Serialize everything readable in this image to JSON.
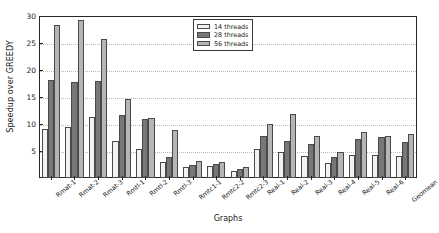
{
  "chart_data": {
    "type": "bar",
    "title": "",
    "xlabel": "Graphs",
    "ylabel": "Speedup over GREEDY",
    "ylim": [
      0,
      30
    ],
    "yticks": [
      5,
      10,
      15,
      20,
      25,
      30
    ],
    "grid": true,
    "legend_position": "top-right",
    "categories": [
      "Rmat-1",
      "Rmat-2",
      "Rmat-3",
      "Rmtl-1",
      "Rmtl-2",
      "Rmtl-3",
      "Rmtc1-1",
      "Rmtc2-2",
      "Rmtc2-3",
      "Real-1",
      "Real-2",
      "Real-3",
      "Real-4",
      "Real-5",
      "Real-6",
      "Geomean"
    ],
    "series": [
      {
        "name": "14 threads",
        "color": "#f2f2f2",
        "values": [
          9.0,
          9.4,
          11.3,
          6.8,
          5.4,
          3.0,
          2.0,
          2.3,
          1.3,
          5.4,
          4.9,
          4.1,
          2.8,
          4.2,
          4.2,
          4.1
        ]
      },
      {
        "name": "28 threads",
        "color": "#777777",
        "values": [
          18.2,
          17.7,
          18.0,
          11.7,
          11.0,
          3.8,
          2.5,
          2.6,
          1.6,
          7.7,
          6.8,
          6.3,
          3.9,
          7.2,
          7.6,
          6.6
        ]
      },
      {
        "name": "56 threads",
        "color": "#b5b5b5",
        "values": [
          28.4,
          29.3,
          25.7,
          14.6,
          11.2,
          8.9,
          3.2,
          3.0,
          2.0,
          10.0,
          11.8,
          7.7,
          4.8,
          8.5,
          7.8,
          8.2
        ]
      }
    ]
  },
  "legend": {
    "items": [
      {
        "label": "14 threads"
      },
      {
        "label": "28 threads"
      },
      {
        "label": "56 threads"
      }
    ]
  }
}
